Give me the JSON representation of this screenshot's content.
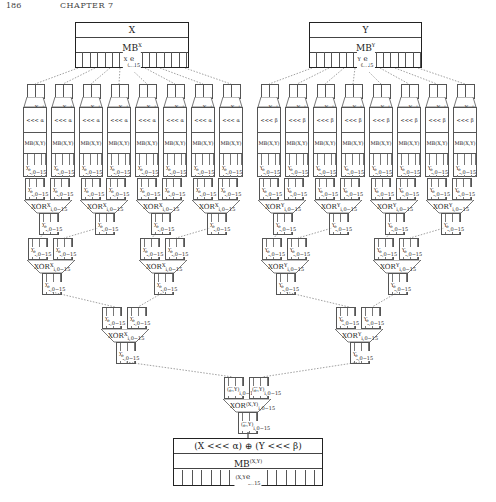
{
  "header": {
    "page_number": "186",
    "running_head": "CHAPTER 7"
  },
  "inputs": {
    "x": {
      "title": "X",
      "mb": "MB",
      "mb_sup": "X",
      "bits": "e",
      "bits_sup": "X",
      "bits_sub": "0..15"
    },
    "y": {
      "title": "Y",
      "mb": "MB",
      "mb_sup": "Y",
      "bits": "e",
      "bits_sup": "Y",
      "bits_sub": "0..15"
    }
  },
  "columns": {
    "x": {
      "rot": "<<< α",
      "mb_xy": "MB(X,Y)",
      "mb_i": "MB",
      "mb_i_sup": "X−i",
      "reg": "e",
      "reg_sup": "X",
      "reg_sub": "i,0−15"
    },
    "y": {
      "rot": "<<< β",
      "mb_xy": "MB(X,Y)",
      "mb_i": "MB",
      "mb_i_sup": "Y−i",
      "reg": "e",
      "reg_sup": "Y",
      "reg_sub": "i,0−15"
    }
  },
  "xor": {
    "label": "XOR",
    "x_sup": "X",
    "y_sup": "Y",
    "xy_sup": "(X,Y)",
    "sub": "i,0−15",
    "reg_x": "e",
    "reg_y": "e",
    "reg_xy": "e"
  },
  "output": {
    "title": "(X <<< α) ⊕ (Y <<< β)",
    "mb": "MB",
    "mb_sup": "(X,Y)",
    "bits": "e",
    "bits_sup": "(X,Y)",
    "bits_sub": "0..15"
  }
}
